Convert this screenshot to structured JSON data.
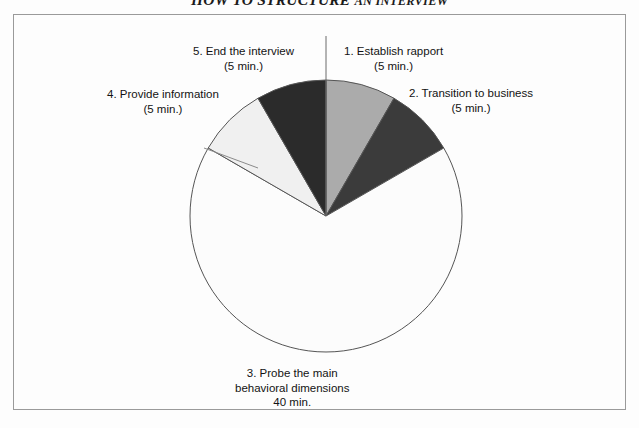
{
  "figure": {
    "title_main": "HOW TO STRUCTURE",
    "title_tail": "AN INTERVIEW",
    "frame_border_color": "#9a9a9a",
    "background_color": "#fdfdfd"
  },
  "chart_data": {
    "type": "pie",
    "title": "HOW TO STRUCTURE AN INTERVIEW",
    "unit": "minutes",
    "total": 60,
    "start_angle_deg": 0,
    "direction": "clockwise",
    "grid": false,
    "legend": false,
    "labels_position": "outside-callout",
    "categories": [
      "1. Establish rapport",
      "2. Transition to business",
      "3. Probe the main behavioral dimensions",
      "4. Provide information",
      "5. End the interview"
    ],
    "values": [
      5,
      5,
      40,
      5,
      5
    ],
    "percentages": [
      8.3,
      8.3,
      66.7,
      8.3,
      8.3
    ],
    "angles_deg": [
      30,
      30,
      240,
      30,
      30
    ],
    "colors": [
      "#ababab",
      "#3b3b3b",
      "#fcfcfc",
      "#f0f0f0",
      "#2b2b2b"
    ],
    "slice_outline_color": "#555555",
    "pie_center": {
      "x": 326,
      "y": 216
    },
    "pie_radius": 136,
    "slices": [
      {
        "index": 1,
        "name": "1. Establish rapport",
        "value": 5,
        "duration_label": "(5 min.)",
        "color": "#ababab",
        "start_deg": 0,
        "end_deg": 30
      },
      {
        "index": 2,
        "name": "2. Transition to business",
        "value": 5,
        "duration_label": "(5 min.)",
        "color": "#3b3b3b",
        "start_deg": 30,
        "end_deg": 60
      },
      {
        "index": 3,
        "name": "3. Probe the main behavioral dimensions",
        "value": 40,
        "duration_label": "40 min.",
        "color": "#fcfcfc",
        "start_deg": 60,
        "end_deg": 300
      },
      {
        "index": 4,
        "name": "4. Provide information",
        "value": 5,
        "duration_label": "(5 min.)",
        "color": "#f0f0f0",
        "start_deg": 300,
        "end_deg": 330
      },
      {
        "index": 5,
        "name": "5. End the interview",
        "value": 5,
        "duration_label": "(5 min.)",
        "color": "#2b2b2b",
        "start_deg": 330,
        "end_deg": 360
      }
    ]
  },
  "labels": {
    "slice1": {
      "line1": "1. Establish rapport",
      "line2": "(5 min.)"
    },
    "slice2": {
      "line1": "2. Transition to business",
      "line2": "(5 min.)"
    },
    "slice3": {
      "line1": "3. Probe the main",
      "line2": "behavioral dimensions",
      "line3": "40 min."
    },
    "slice4": {
      "line1": "4. Provide information",
      "line2": "(5 min.)"
    },
    "slice5": {
      "line1": "5. End the interview",
      "line2": "(5 min.)"
    }
  }
}
